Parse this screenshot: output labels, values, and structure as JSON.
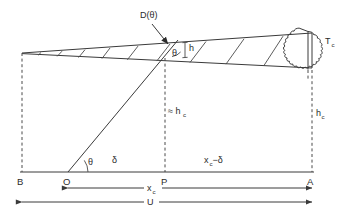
{
  "figure": {
    "type": "technical-line-diagram",
    "colors": {
      "ink": "#3a3a3a",
      "background": "#ffffff",
      "dashed": "#4a4a4a"
    }
  },
  "labels": {
    "d_theta": "D(θ)",
    "theta_cone": "θ",
    "h": "h",
    "t_c": "T",
    "t_c_sub": "c",
    "approx_hc": "≈ h",
    "approx_hc_sub": "c",
    "hc": "h",
    "hc_sub": "c",
    "point_b": "B",
    "point_o": "O",
    "point_p": "P",
    "point_a": "A",
    "theta_base": "θ",
    "delta": "δ",
    "xc_minus_delta": "x",
    "xc_minus_delta_sub": "c",
    "xc_minus_delta_tail": "−δ",
    "xc_dim": "x",
    "xc_dim_sub": "c",
    "u_dim": "U"
  },
  "geometry": {
    "baseline_y": 172,
    "apex": {
      "x": 22,
      "y": 53
    },
    "point_b": {
      "x": 22,
      "y": 172
    },
    "point_o": {
      "x": 68,
      "y": 172
    },
    "point_p": {
      "x": 165,
      "y": 172
    },
    "point_a": {
      "x": 312,
      "y": 172
    },
    "cone_top_right": {
      "x": 312,
      "y": 33
    },
    "cone_bottom_right": {
      "x": 312,
      "y": 68
    },
    "ray_end": {
      "x": 178,
      "y": 40
    },
    "cross_lines": [
      40,
      60,
      82,
      105,
      130,
      158,
      192,
      228,
      265
    ],
    "blob_center_x": 308,
    "xc_dim_y": 188,
    "u_dim_y": 202
  }
}
